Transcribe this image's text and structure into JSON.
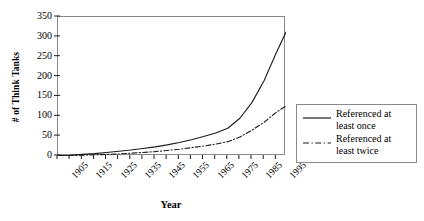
{
  "chart_data": {
    "type": "line",
    "title": "",
    "xlabel": "Year",
    "ylabel": "# of Think Tanks",
    "xlim": [
      1905,
      1999
    ],
    "ylim": [
      0,
      350
    ],
    "y_ticks": [
      0,
      50,
      100,
      150,
      200,
      250,
      300,
      350
    ],
    "x_tick_labels": [
      "1905",
      "1915",
      "1925",
      "1935",
      "1945",
      "1955",
      "1965",
      "1975",
      "1985",
      "1995"
    ],
    "x_tick_interval_years": 5,
    "grid": false,
    "legend_position": "right-outside",
    "x": [
      1905,
      1910,
      1915,
      1920,
      1925,
      1930,
      1935,
      1940,
      1945,
      1950,
      1955,
      1960,
      1965,
      1970,
      1975,
      1980,
      1985,
      1990,
      1995,
      1999
    ],
    "series": [
      {
        "name": "Referenced at least once",
        "style": "solid",
        "color": "#1a1a1a",
        "values": [
          1,
          2,
          4,
          6,
          9,
          12,
          15,
          19,
          23,
          28,
          34,
          41,
          49,
          58,
          70,
          95,
          135,
          190,
          260,
          312
        ]
      },
      {
        "name": "Referenced at least twice",
        "style": "dash-dot",
        "color": "#1a1a1a",
        "values": [
          0,
          1,
          2,
          3,
          4,
          5,
          7,
          9,
          11,
          14,
          17,
          21,
          25,
          30,
          36,
          48,
          65,
          85,
          110,
          126
        ]
      }
    ]
  },
  "axes": {
    "y_title": "# of Think Tanks",
    "x_title": "Year",
    "y_ticks": [
      "350",
      "300",
      "250",
      "200",
      "150",
      "100",
      "50",
      "0"
    ],
    "x_ticks": [
      "1905",
      "1915",
      "1925",
      "1935",
      "1945",
      "1955",
      "1965",
      "1975",
      "1985",
      "1995"
    ]
  },
  "legend": {
    "entries": [
      {
        "label_line1": "Referenced at",
        "label_line2": "least once",
        "style": "solid"
      },
      {
        "label_line1": "Referenced at",
        "label_line2": "least twice",
        "style": "dash-dot"
      }
    ]
  },
  "colors": {
    "line": "#1a1a1a",
    "frame": "#8a8a8a",
    "background": "#ffffff"
  }
}
